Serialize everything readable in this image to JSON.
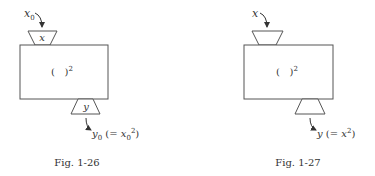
{
  "figures": [
    {
      "caption": "Fig. 1-26",
      "input_label": "x",
      "input_sub": "0",
      "top_funnel_label": "x",
      "box_label": "(   )",
      "box_exp": "2",
      "bottom_funnel_label": "y",
      "output_label": "y",
      "output_sub": "0",
      "output_eq_open": " (= ",
      "output_eq_var": "x",
      "output_eq_sub": "0",
      "output_eq_exp": "2",
      "output_eq_close": ")"
    },
    {
      "caption": "Fig. 1-27",
      "input_label": "x",
      "box_label": "(   )",
      "box_exp": "2",
      "output_label": "y",
      "output_eq_open": " (= ",
      "output_eq_var": "x",
      "output_eq_exp": "2",
      "output_eq_close": ")"
    }
  ],
  "colors": {
    "line": "#555555",
    "text": "#333333",
    "background": "#ffffff"
  }
}
